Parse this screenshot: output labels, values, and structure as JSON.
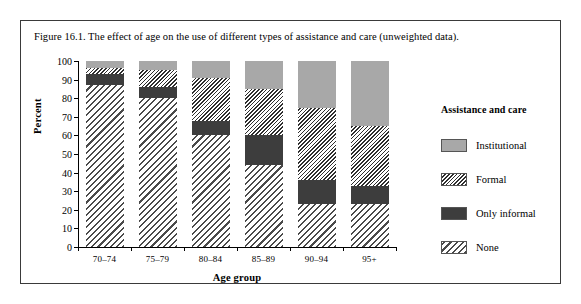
{
  "figure": {
    "caption": "Figure 16.1. The effect of age on the use of different types of assistance and care (unweighted data)."
  },
  "legend": {
    "title": "Assistance and care",
    "entries": [
      {
        "label": "Institutional",
        "swatch": "solid-gray-swatch"
      },
      {
        "label": "Formal",
        "swatch": "fine-hatch-swatch"
      },
      {
        "label": "Only informal",
        "swatch": "solid-dark-swatch"
      },
      {
        "label": "None",
        "swatch": "coarse-hatch-swatch"
      }
    ]
  },
  "colors": {
    "institutional": "#a8a8a8",
    "only_informal": "#3d3d3d",
    "formal_hatch": "#2e2e2e",
    "none_hatch": "#4a4a4a",
    "frame": "#3a3a3a",
    "axis": "#000000"
  },
  "chart_data": {
    "type": "bar",
    "stacked": true,
    "title": "Figure 16.1. The effect of age on the use of different types of assistance and care (unweighted data).",
    "xlabel": "Age group",
    "ylabel": "Percent",
    "ylim": [
      0,
      100
    ],
    "yticks": [
      0,
      10,
      20,
      30,
      40,
      50,
      60,
      70,
      80,
      90,
      100
    ],
    "grid": false,
    "legend_position": "right",
    "categories": [
      "70–74",
      "75–79",
      "80–84",
      "85–89",
      "90–94",
      "95+"
    ],
    "series": [
      {
        "name": "None",
        "values": [
          87,
          80,
          60,
          44,
          23,
          23
        ]
      },
      {
        "name": "Only informal",
        "values": [
          6,
          6,
          8,
          16,
          13,
          10
        ]
      },
      {
        "name": "Formal",
        "values": [
          3,
          9,
          23,
          25,
          39,
          32
        ]
      },
      {
        "name": "Institutional",
        "values": [
          4,
          5,
          9,
          15,
          25,
          35
        ]
      }
    ]
  }
}
